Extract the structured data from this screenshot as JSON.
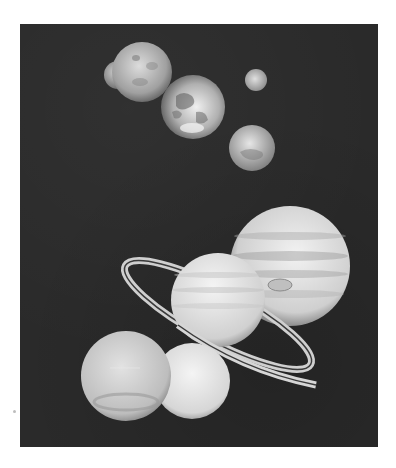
{
  "image": {
    "description": "Grayscale montage of solar system planets on a dark background",
    "background_color": "#2a2a2a",
    "page_color": "#ffffff"
  },
  "planets": [
    {
      "name": "Mercury",
      "cx": 118,
      "cy": 75,
      "r": 14,
      "tone": "#a8a8a8"
    },
    {
      "name": "Venus",
      "cx": 142,
      "cy": 72,
      "r": 30,
      "tone": "#b8b8b8"
    },
    {
      "name": "Earth",
      "cx": 193,
      "cy": 107,
      "r": 32,
      "tone": "#c8c8c8"
    },
    {
      "name": "Moon",
      "cx": 256,
      "cy": 80,
      "r": 11,
      "tone": "#c0c0c0"
    },
    {
      "name": "Mars",
      "cx": 252,
      "cy": 148,
      "r": 23,
      "tone": "#c4c4c4"
    },
    {
      "name": "Jupiter",
      "cx": 290,
      "cy": 266,
      "r": 60,
      "tone": "#d4d4d4"
    },
    {
      "name": "Saturn",
      "cx": 218,
      "cy": 300,
      "r": 47,
      "tone": "#dedede"
    },
    {
      "name": "Neptune",
      "cx": 126,
      "cy": 376,
      "r": 45,
      "tone": "#cfcfcf"
    },
    {
      "name": "Uranus",
      "cx": 192,
      "cy": 381,
      "r": 38,
      "tone": "#e0e0e0"
    }
  ]
}
